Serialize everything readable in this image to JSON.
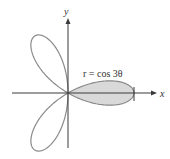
{
  "figure": {
    "equation_label": "r = cos 3θ",
    "x_axis_label": "x",
    "y_axis_label": "y",
    "curve": {
      "type": "polar-rose",
      "formula": "r = cos 3θ",
      "petals": 3,
      "shaded_region": "petal along positive x-axis, -π/6 ≤ θ ≤ π/6"
    },
    "colors": {
      "axis": "#3a3a3a",
      "curve": "#8a8a8a",
      "shade": "#d9d9d9"
    }
  }
}
